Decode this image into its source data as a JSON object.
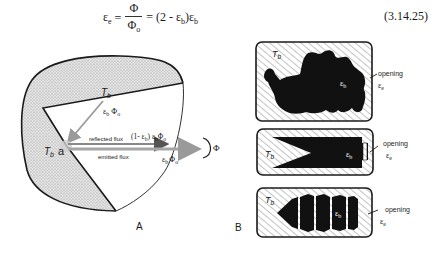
{
  "equation": {
    "lhs": "ε",
    "lhs_sub": "e",
    "eq1": "=",
    "numerator": "Φ",
    "denominator": "Φ",
    "denominator_sub": "o",
    "rhs": "= (2 - ε",
    "rhs_sub1": "b",
    "rhs_mid": ")ε",
    "rhs_sub2": "b",
    "number": "(3.14.25)"
  },
  "panel_a": {
    "label": "A",
    "top_temp": "T",
    "top_temp_sub": "b",
    "left_temp": "T",
    "left_temp_sub": "b",
    "point_label": "a",
    "incident_flux": "ε",
    "incident_flux_sub": "b",
    "incident_flux_phi": "Φ",
    "incident_flux_phi_sub": "o",
    "reflected_label": "reflected flux",
    "emitted_label": "emitted flux",
    "reflected_value": "(1- ε",
    "reflected_value_sub": "b",
    "reflected_value_tail": ") ε",
    "reflected_value_sub2": "b",
    "reflected_value_phi": "Φ",
    "reflected_value_phi_sub": "o",
    "emitted_value": "ε",
    "emitted_value_sub": "b",
    "emitted_value_phi": "Φ",
    "emitted_value_phi_sub": "o",
    "total_flux": "Φ"
  },
  "panel_b": {
    "label": "B",
    "cavities": [
      {
        "temp": "T",
        "temp_sub": "b",
        "emissivity": "ε",
        "emissivity_sub": "b",
        "opening": "opening",
        "opening_eps": "ε",
        "opening_eps_sub": "e"
      },
      {
        "temp": "T",
        "temp_sub": "b",
        "emissivity": "ε",
        "emissivity_sub": "b",
        "opening": "opening",
        "opening_eps": "ε",
        "opening_eps_sub": "e"
      },
      {
        "temp": "T",
        "temp_sub": "b",
        "emissivity": "ε",
        "emissivity_sub": "b",
        "opening": "opening",
        "opening_eps": "ε",
        "opening_eps_sub": "e"
      }
    ]
  },
  "colors": {
    "ink": "#1a1a1a",
    "arrow_gray": "#9a9a9a",
    "stipple": "#8c8c8c",
    "hatch": "#7a7a7a"
  }
}
